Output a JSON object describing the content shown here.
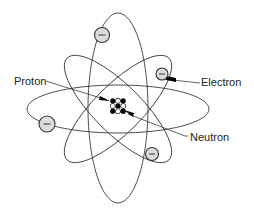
{
  "labels": {
    "proton": "Proton",
    "electron": "Electron",
    "neutron": "Neutron"
  },
  "electron_symbol": "−",
  "colors": {
    "line": "#3a3a3a",
    "electron_fill": "#dcdcdc",
    "proton_fill": "#000000",
    "neutron_fill": "#ffffff"
  },
  "counts": {
    "orbits": 4,
    "electrons": 4
  },
  "nucleus": {
    "grid": [
      [
        "proton",
        "neutron",
        "proton"
      ],
      [
        "neutron",
        "proton",
        "neutron"
      ],
      [
        "proton",
        "neutron",
        "proton"
      ]
    ]
  }
}
